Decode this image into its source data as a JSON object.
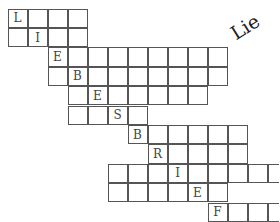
{
  "title": "Lie",
  "grid": {
    "origin_x": 8,
    "origin_y": 9,
    "cell_w": 20,
    "cell_h": 19.4,
    "rows": [
      {
        "start": 0,
        "end": 3,
        "letter_col": 0,
        "letter": "L"
      },
      {
        "start": 0,
        "end": 3,
        "letter_col": 1,
        "letter": "I"
      },
      {
        "start": 2,
        "end": 10,
        "letter_col": 2,
        "letter": "E"
      },
      {
        "start": 2,
        "end": 10,
        "letter_col": 3,
        "letter": "B"
      },
      {
        "start": 3,
        "end": 9,
        "letter_col": 4,
        "letter": "E"
      },
      {
        "start": 3,
        "end": 6,
        "letter_col": 5,
        "letter": "S"
      },
      {
        "start": 6,
        "end": 11,
        "letter_col": 6,
        "letter": "B"
      },
      {
        "start": 7,
        "end": 11,
        "letter_col": 7,
        "letter": "R"
      },
      {
        "start": 5,
        "end": 13,
        "letter_col": 8,
        "letter": "I"
      },
      {
        "start": 5,
        "end": 10,
        "letter_col": 9,
        "letter": "E"
      },
      {
        "start": 10,
        "end": 13,
        "letter_col": 10,
        "letter": "F"
      }
    ]
  }
}
